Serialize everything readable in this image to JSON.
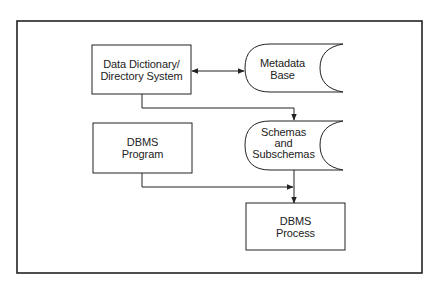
{
  "diagram": {
    "nodes": [
      {
        "id": "dd",
        "shape": "rectangle",
        "lines": [
          "Data Dictionary/",
          "Directory System"
        ]
      },
      {
        "id": "meta",
        "shape": "stored-data",
        "lines": [
          "Metadata",
          "Base"
        ]
      },
      {
        "id": "prog",
        "shape": "rectangle",
        "lines": [
          "DBMS",
          "Program"
        ]
      },
      {
        "id": "schemas",
        "shape": "stored-data",
        "lines": [
          "Schemas",
          "and",
          "Subschemas"
        ]
      },
      {
        "id": "proc",
        "shape": "rectangle",
        "lines": [
          "DBMS",
          "Process"
        ]
      }
    ],
    "edges": [
      {
        "from": "dd",
        "to": "meta",
        "type": "bidirectional"
      },
      {
        "from": "dd",
        "to": "schemas",
        "type": "directed"
      },
      {
        "from": "prog",
        "to": "proc",
        "type": "directed"
      },
      {
        "from": "schemas",
        "to": "proc",
        "type": "directed"
      }
    ],
    "colors": {
      "stroke": "#222222",
      "background": "#ffffff"
    }
  }
}
